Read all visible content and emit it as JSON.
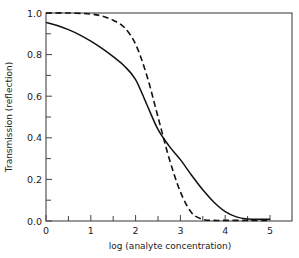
{
  "chart_data": {
    "type": "line",
    "title": "",
    "xlabel": "log (analyte concentration)",
    "ylabel": "Transmission  (reflection)",
    "xlim": [
      0,
      5.5
    ],
    "ylim": [
      0,
      1.0
    ],
    "x_ticks": [
      0,
      1,
      2,
      3,
      4,
      5
    ],
    "x_minor_ticks": [
      0.5,
      1.5,
      2.5,
      3.5,
      4.5
    ],
    "y_ticks": [
      "0.0",
      "0.2",
      "0.4",
      "0.6",
      "0.8",
      "1.0"
    ],
    "y_tick_values": [
      0.0,
      0.2,
      0.4,
      0.6,
      0.8,
      1.0
    ],
    "y_minor_ticks": [
      0.1,
      0.3,
      0.5,
      0.7,
      0.9
    ],
    "grid": false,
    "legend": null,
    "series": [
      {
        "name": "solid",
        "style": "solid",
        "x": [
          0,
          0.25,
          0.5,
          0.75,
          1.0,
          1.25,
          1.5,
          1.75,
          2.0,
          2.25,
          2.5,
          2.75,
          3.0,
          3.25,
          3.5,
          3.75,
          4.0,
          4.25,
          4.5,
          4.75,
          5.0
        ],
        "y": [
          0.955,
          0.94,
          0.92,
          0.895,
          0.865,
          0.83,
          0.79,
          0.745,
          0.68,
          0.56,
          0.44,
          0.36,
          0.295,
          0.22,
          0.15,
          0.09,
          0.045,
          0.02,
          0.01,
          0.008,
          0.008
        ]
      },
      {
        "name": "dashed",
        "style": "dashed",
        "x": [
          0,
          0.5,
          1.0,
          1.25,
          1.5,
          1.75,
          2.0,
          2.25,
          2.5,
          2.75,
          3.0,
          3.25,
          3.5,
          3.75,
          4.0,
          4.5,
          5.0
        ],
        "y": [
          1.0,
          1.0,
          0.995,
          0.985,
          0.965,
          0.93,
          0.85,
          0.7,
          0.5,
          0.3,
          0.14,
          0.04,
          0.008,
          0.003,
          0.003,
          0.003,
          0.003
        ]
      }
    ]
  },
  "axes": {
    "x_title": "log (analyte concentration)",
    "y_title": "Transmission  (reflection)"
  }
}
